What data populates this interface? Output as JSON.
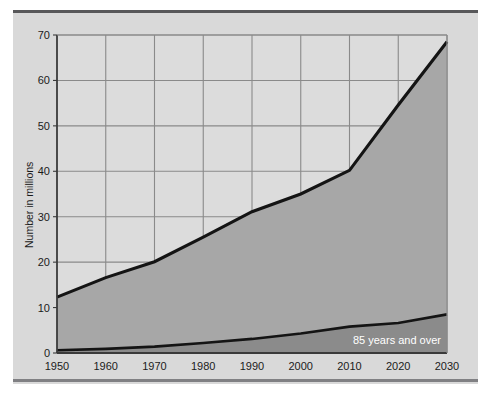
{
  "chart_data": {
    "type": "area",
    "title": "",
    "subtitle": "",
    "xlabel": "",
    "ylabel": "Number in millions",
    "x": [
      1950,
      1960,
      1970,
      1980,
      1990,
      2000,
      2010,
      2020,
      2030
    ],
    "xlim": [
      1950,
      2030
    ],
    "ylim": [
      0,
      70
    ],
    "ytick_labels": [
      "0",
      "10",
      "20",
      "30",
      "40",
      "50",
      "60",
      "70"
    ],
    "yticks": [
      0,
      10,
      20,
      30,
      40,
      50,
      60,
      70
    ],
    "xtick_labels": [
      "1950",
      "1960",
      "1970",
      "1980",
      "1990",
      "2000",
      "2010",
      "2020",
      "2030"
    ],
    "xticks": [
      1950,
      1960,
      1970,
      1980,
      1990,
      2000,
      2010,
      2020,
      2030
    ],
    "grid": true,
    "legend_position": "inline-on-band",
    "series": [
      {
        "name": "65 years and over",
        "label_shown": false,
        "values": [
          12.3,
          16.6,
          20.1,
          25.5,
          31.1,
          35.0,
          40.2,
          54.6,
          68.5
        ],
        "fill_color": "#a7a7a7",
        "line_color": "#141414"
      },
      {
        "name": "85 years and over",
        "label_shown": true,
        "values": [
          0.6,
          0.9,
          1.4,
          2.2,
          3.1,
          4.3,
          5.8,
          6.6,
          8.5
        ],
        "fill_color": "#8b8b8b",
        "line_color": "#141414"
      }
    ],
    "annotations": [
      {
        "text": "85 years and over",
        "x": 2022,
        "y": 3.2,
        "color": "#ffffff"
      }
    ],
    "colors": {
      "panel_background": "#d9d9d9",
      "plot_background": "#dcdcdc",
      "grid_line": "#8a8a8a",
      "axis_line": "#3a3a3a",
      "rule_top": "#58585a",
      "rule_bottom": "#808083",
      "upper_band_fill": "#a7a7a7",
      "lower_band_fill": "#8b8b8b",
      "curve_stroke": "#141414",
      "tick_text": "#1b1b1b",
      "legend_text": "#ffffff"
    }
  }
}
